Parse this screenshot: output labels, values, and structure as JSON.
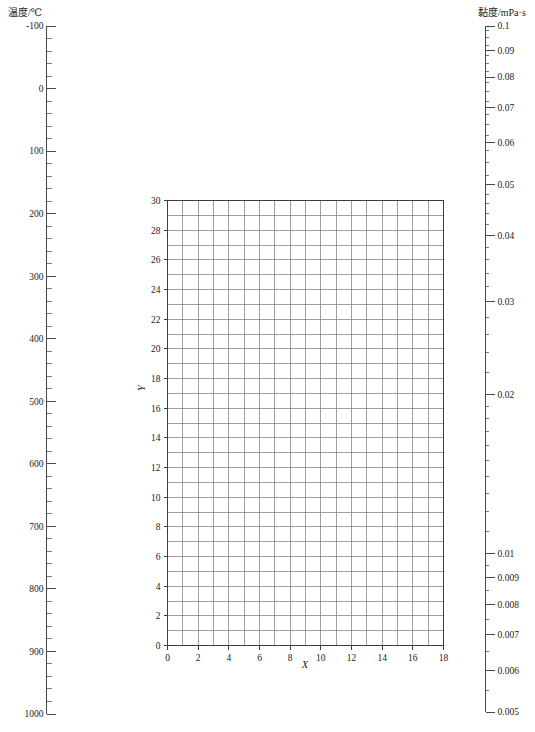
{
  "figure": {
    "name": "nomogram-temperature-viscosity",
    "background_color": "#ffffff",
    "line_color": "#4a4a4a",
    "grid_color": "#767676"
  },
  "left_axis": {
    "title": "温度/℃",
    "unit": "℃",
    "quantity": "温度",
    "orientation": "vertical",
    "direction": "top-to-bottom-increasing",
    "range": [
      -100,
      1000
    ],
    "major_step": 100,
    "minor_step": 20,
    "major_ticks": [
      {
        "value": -100,
        "label": "-100"
      },
      {
        "value": 0,
        "label": "0"
      },
      {
        "value": 100,
        "label": "100"
      },
      {
        "value": 200,
        "label": "200"
      },
      {
        "value": 300,
        "label": "300"
      },
      {
        "value": 400,
        "label": "400"
      },
      {
        "value": 500,
        "label": "500"
      },
      {
        "value": 600,
        "label": "600"
      },
      {
        "value": 700,
        "label": "700"
      },
      {
        "value": 800,
        "label": "800"
      },
      {
        "value": 900,
        "label": "900"
      },
      {
        "value": 1000,
        "label": "1000"
      }
    ]
  },
  "right_axis": {
    "title": "黏度/mPa·s",
    "unit": "mPa·s",
    "quantity": "黏度",
    "orientation": "vertical",
    "scale": "log",
    "direction": "top-to-bottom-decreasing",
    "range": [
      0.1,
      0.005
    ],
    "major_ticks": [
      {
        "value": 0.1,
        "label": "0.1"
      },
      {
        "value": 0.09,
        "label": "0.09"
      },
      {
        "value": 0.08,
        "label": "0.08"
      },
      {
        "value": 0.07,
        "label": "0.07"
      },
      {
        "value": 0.06,
        "label": "0.06"
      },
      {
        "value": 0.05,
        "label": "0.05"
      },
      {
        "value": 0.04,
        "label": "0.04"
      },
      {
        "value": 0.03,
        "label": "0.03"
      },
      {
        "value": 0.02,
        "label": "0.02"
      },
      {
        "value": 0.01,
        "label": "0.01"
      },
      {
        "value": 0.009,
        "label": "0.009"
      },
      {
        "value": 0.008,
        "label": "0.008"
      },
      {
        "value": 0.007,
        "label": "0.007"
      },
      {
        "value": 0.006,
        "label": "0.006"
      },
      {
        "value": 0.005,
        "label": "0.005"
      }
    ]
  },
  "chart_data": {
    "type": "table",
    "title": "",
    "subtitle": "",
    "xlabel": "X",
    "ylabel": "Y",
    "xlim": [
      0,
      18
    ],
    "ylim": [
      0,
      30
    ],
    "grid": true,
    "grid_step_x": 1,
    "grid_step_y": 1,
    "legend": null,
    "legend_position": "none",
    "series": [],
    "x_tick_labels": [
      "0",
      "2",
      "4",
      "6",
      "8",
      "10",
      "12",
      "14",
      "16",
      "18"
    ],
    "x_tick_values": [
      0,
      2,
      4,
      6,
      8,
      10,
      12,
      14,
      16,
      18
    ],
    "y_tick_labels": [
      "0",
      "2",
      "4",
      "6",
      "8",
      "10",
      "12",
      "14",
      "16",
      "18",
      "20",
      "22",
      "24",
      "26",
      "28",
      "30"
    ],
    "y_tick_values": [
      0,
      2,
      4,
      6,
      8,
      10,
      12,
      14,
      16,
      18,
      20,
      22,
      24,
      26,
      28,
      30
    ],
    "annotations": [],
    "note": "Empty plotting grid (blank graph paper) flanked by a linear temperature scale on the left and a logarithmic viscosity scale on the right."
  }
}
